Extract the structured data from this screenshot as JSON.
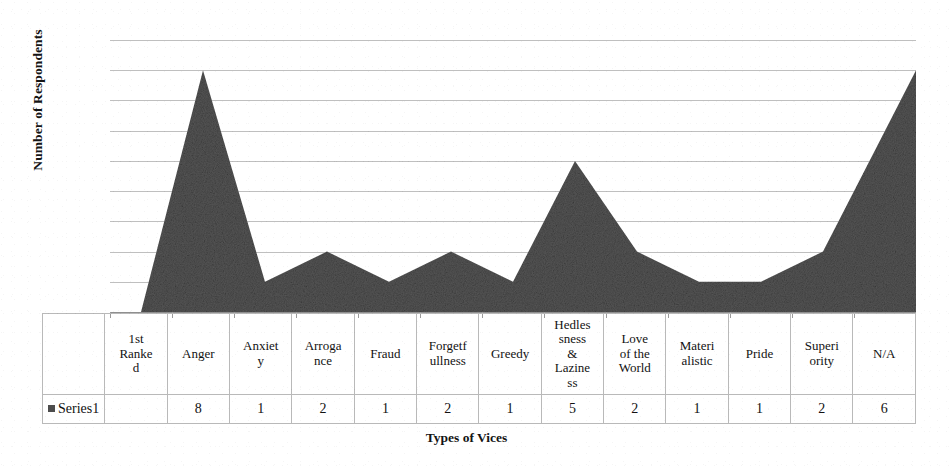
{
  "chart_data": {
    "type": "area",
    "title": "",
    "xlabel": "Types of Vices",
    "ylabel": "Number of Respondents",
    "ylim": [
      0,
      9
    ],
    "yticks": [
      0,
      1,
      2,
      3,
      4,
      5,
      6,
      7,
      8,
      9
    ],
    "grid": true,
    "legend_position": "table-left",
    "series_name": "Series1",
    "series_color": "#565656",
    "categories": [
      "1st Ranked",
      "Anger",
      "Anxiety",
      "Arrogance",
      "Fraud",
      "Forgetfullness",
      "Greedy",
      "Hedlessness & Laziness",
      "Love of the World",
      "Materialistic",
      "Pride",
      "Superiority",
      "N/A"
    ],
    "categories_wrapped": [
      "1st\nRanke\nd",
      "Anger",
      "Anxiet\ny",
      "Arroga\nnce",
      "Fraud",
      "Forgetf\nullness",
      "Greedy",
      "Hedles\nsness\n&\nLazine\nss",
      "Love\nof the\nWorld",
      "Materi\nalistic",
      "Pride",
      "Superi\nority",
      "N/A"
    ],
    "values": [
      0,
      8,
      1,
      2,
      1,
      2,
      1,
      5,
      2,
      1,
      1,
      2,
      6
    ],
    "value_labels": [
      "",
      "8",
      "1",
      "2",
      "1",
      "2",
      "1",
      "5",
      "2",
      "1",
      "1",
      "2",
      "6"
    ]
  },
  "axes": {
    "y_title": "Number of Respondents",
    "x_title": "Types of Vices",
    "y_tick_labels": [
      "9",
      "8",
      "7",
      "6",
      "5",
      "4",
      "3",
      "2",
      "1",
      "0"
    ]
  },
  "table": {
    "legend_label": "Series1",
    "legend_swatch_color": "#4d4d4d",
    "category_row": [
      "1st\nRanke\nd",
      "Anger",
      "Anxiet\ny",
      "Arroga\nnce",
      "Fraud",
      "Forgetf\nullness",
      "Greedy",
      "Hedles\nsness\n&\nLazine\nss",
      "Love\nof the\nWorld",
      "Materi\nalistic",
      "Pride",
      "Superi\nority",
      "N/A"
    ],
    "value_row": [
      "",
      "8",
      "1",
      "2",
      "1",
      "2",
      "1",
      "5",
      "2",
      "1",
      "1",
      "2",
      "6"
    ]
  }
}
